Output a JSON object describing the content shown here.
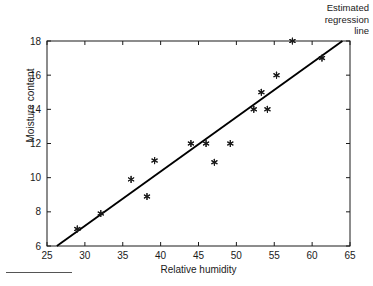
{
  "chart_data": {
    "type": "scatter",
    "title": "",
    "xlabel": "Relative humidity",
    "ylabel": "Moisture content",
    "xlim": [
      25,
      65
    ],
    "ylim": [
      6,
      18
    ],
    "xticks": [
      25,
      30,
      35,
      40,
      45,
      50,
      55,
      60,
      65
    ],
    "yticks": [
      6,
      8,
      10,
      12,
      14,
      16,
      18
    ],
    "grid": false,
    "legend": null,
    "annotations": [
      {
        "text": "Estimated regression line",
        "position": "top-right"
      }
    ],
    "marker": "asterisk",
    "points": [
      {
        "x": 29.0,
        "y": 7.0
      },
      {
        "x": 32.1,
        "y": 7.9
      },
      {
        "x": 36.1,
        "y": 9.9
      },
      {
        "x": 38.2,
        "y": 8.9
      },
      {
        "x": 39.2,
        "y": 11.0
      },
      {
        "x": 44.0,
        "y": 12.0
      },
      {
        "x": 46.0,
        "y": 12.0
      },
      {
        "x": 47.1,
        "y": 10.9
      },
      {
        "x": 49.2,
        "y": 12.0
      },
      {
        "x": 52.3,
        "y": 14.0
      },
      {
        "x": 53.3,
        "y": 15.0
      },
      {
        "x": 54.1,
        "y": 14.0
      },
      {
        "x": 55.3,
        "y": 16.0
      },
      {
        "x": 57.4,
        "y": 18.0
      },
      {
        "x": 61.3,
        "y": 17.0
      }
    ],
    "regression_line": {
      "x_start": 26.3,
      "y_start": 6.0,
      "x_end": 64.0,
      "y_end": 18.0
    },
    "axis_color": "#1a1a1a",
    "marker_color": "#1a1a1a",
    "line_color": "#000000"
  },
  "annotation": {
    "line1": "Estimated",
    "line2": "regression",
    "line3": "line"
  },
  "labels": {
    "x_axis": "Relative humidity",
    "y_axis": "Moisture content"
  }
}
